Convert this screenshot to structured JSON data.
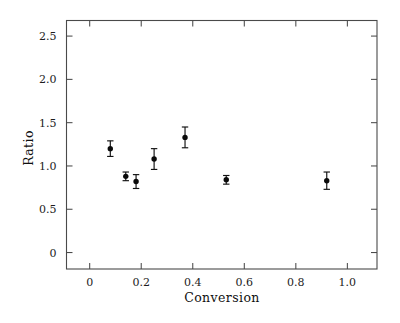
{
  "chart_data": {
    "type": "scatter",
    "title": "",
    "xlabel": "Conversion",
    "ylabel": "Ratio",
    "xlim": [
      -0.09,
      1.115
    ],
    "ylim": [
      -0.19,
      2.68
    ],
    "grid": false,
    "legend": "none",
    "xticks": [
      0,
      0.2,
      0.4,
      0.6,
      0.8,
      1.0
    ],
    "xtick_labels": [
      "0",
      "0.2",
      "0.4",
      "0.6",
      "0.8",
      "1.0"
    ],
    "yticks": [
      0,
      0.5,
      1.0,
      1.5,
      2.0,
      2.5
    ],
    "ytick_labels": [
      "0",
      "0.5",
      "1.0",
      "1.5",
      "2.0",
      "2.5"
    ],
    "marker": "filled-circle",
    "error_bars": "symmetric-vertical",
    "x": [
      0.08,
      0.14,
      0.18,
      0.25,
      0.37,
      0.53,
      0.92
    ],
    "y": [
      1.2,
      0.88,
      0.82,
      1.08,
      1.33,
      0.84,
      0.83
    ],
    "yerr": [
      0.09,
      0.05,
      0.08,
      0.12,
      0.12,
      0.05,
      0.1
    ],
    "points": [
      {
        "x": 0.08,
        "y": 1.2,
        "yerr": 0.09
      },
      {
        "x": 0.14,
        "y": 0.88,
        "yerr": 0.05
      },
      {
        "x": 0.18,
        "y": 0.82,
        "yerr": 0.08
      },
      {
        "x": 0.25,
        "y": 1.08,
        "yerr": 0.12
      },
      {
        "x": 0.37,
        "y": 1.33,
        "yerr": 0.12
      },
      {
        "x": 0.53,
        "y": 0.84,
        "yerr": 0.05
      },
      {
        "x": 0.92,
        "y": 0.83,
        "yerr": 0.1
      }
    ],
    "colors": {
      "marker": "#0a0a0a",
      "errorbar": "#111111",
      "axis": "#4a4a4a",
      "background": "#ffffff"
    }
  }
}
